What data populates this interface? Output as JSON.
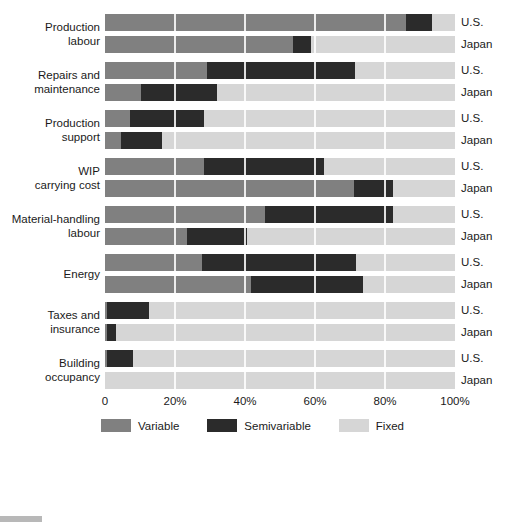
{
  "chart_data": {
    "type": "bar",
    "subtype": "stacked-horizontal-100",
    "title": "",
    "xlabel": "",
    "ylabel": "",
    "xlim": [
      0,
      100
    ],
    "xticks": [
      0,
      20,
      40,
      60,
      80,
      100
    ],
    "xtick_labels": [
      "0",
      "20%",
      "40%",
      "60%",
      "80%",
      "100%"
    ],
    "grid": true,
    "legend_position": "bottom",
    "legend": [
      "Variable",
      "Semivariable",
      "Fixed"
    ],
    "series_names": [
      "Variable",
      "Semivariable",
      "Fixed"
    ],
    "colors": {
      "variable": "#808080",
      "semivariable": "#2b2b2b",
      "fixed": "#d6d6d6",
      "background": "#ffffff",
      "gridline": "#ffffff",
      "text": "#1a1a1a"
    },
    "categories": [
      "Production labour",
      "Repairs and maintenance",
      "Production support",
      "WIP carrying cost",
      "Material-handling labour",
      "Energy",
      "Taxes and insurance",
      "Building occupancy"
    ],
    "groups": [
      "U.S.",
      "Japan"
    ],
    "rows": [
      {
        "category": "Production labour",
        "group": "U.S.",
        "variable": 86.0,
        "semivariable": 7.3,
        "fixed": 6.7
      },
      {
        "category": "Production labour",
        "group": "Japan",
        "variable": 53.6,
        "semivariable": 5.2,
        "fixed": 41.2
      },
      {
        "category": "Repairs and maintenance",
        "group": "U.S.",
        "variable": 29.0,
        "semivariable": 42.4,
        "fixed": 28.6
      },
      {
        "category": "Repairs and maintenance",
        "group": "Japan",
        "variable": 10.2,
        "semivariable": 21.7,
        "fixed": 68.1
      },
      {
        "category": "Production support",
        "group": "U.S.",
        "variable": 7.0,
        "semivariable": 21.3,
        "fixed": 71.7
      },
      {
        "category": "Production support",
        "group": "Japan",
        "variable": 4.5,
        "semivariable": 11.7,
        "fixed": 83.8
      },
      {
        "category": "WIP carrying cost",
        "group": "U.S.",
        "variable": 28.3,
        "semivariable": 34.3,
        "fixed": 37.4
      },
      {
        "category": "WIP carrying cost",
        "group": "Japan",
        "variable": 71.0,
        "semivariable": 11.2,
        "fixed": 17.8
      },
      {
        "category": "Material-handling labour",
        "group": "U.S.",
        "variable": 45.7,
        "semivariable": 36.5,
        "fixed": 17.8
      },
      {
        "category": "Material-handling labour",
        "group": "Japan",
        "variable": 23.3,
        "semivariable": 17.2,
        "fixed": 59.5
      },
      {
        "category": "Energy",
        "group": "U.S.",
        "variable": 27.6,
        "semivariable": 44.1,
        "fixed": 28.3
      },
      {
        "category": "Energy",
        "group": "Japan",
        "variable": 41.6,
        "semivariable": 32.0,
        "fixed": 26.4
      },
      {
        "category": "Taxes and insurance",
        "group": "U.S.",
        "variable": 0.5,
        "semivariable": 12.2,
        "fixed": 87.3
      },
      {
        "category": "Taxes and insurance",
        "group": "Japan",
        "variable": 0.5,
        "semivariable": 2.6,
        "fixed": 96.9
      },
      {
        "category": "Building occupancy",
        "group": "U.S.",
        "variable": 0.5,
        "semivariable": 7.5,
        "fixed": 92.0
      },
      {
        "category": "Building occupancy",
        "group": "Japan",
        "variable": 0.0,
        "semivariable": 0.0,
        "fixed": 100.0
      }
    ]
  }
}
